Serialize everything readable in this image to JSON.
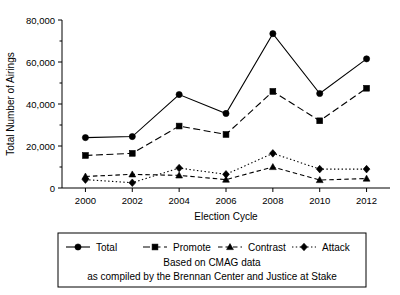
{
  "chart_data": {
    "type": "line",
    "title": "",
    "xlabel": "Election Cycle",
    "ylabel": "Total Number of Airings",
    "categories": [
      "2000",
      "2002",
      "2004",
      "2006",
      "2008",
      "2010",
      "2012"
    ],
    "x": [
      2000,
      2002,
      2004,
      2006,
      2008,
      2010,
      2012
    ],
    "xlim": [
      1999,
      2013
    ],
    "ylim": [
      0,
      80000
    ],
    "yticks": [
      0,
      20000,
      40000,
      60000,
      80000
    ],
    "ytick_labels": [
      "0",
      "20,000",
      "40,000",
      "60,000",
      "80,000"
    ],
    "yminor_ticks": [
      10000,
      30000,
      50000,
      70000
    ],
    "xtick_labels": [
      "2000",
      "2002",
      "2004",
      "2006",
      "2008",
      "2010",
      "2012"
    ],
    "grid": false,
    "legend_position": "below-plot",
    "series": [
      {
        "name": "Total",
        "marker": "circle",
        "linestyle": "solid",
        "color": "#000000",
        "values": [
          24000,
          24500,
          44500,
          35500,
          73500,
          45000,
          61500
        ]
      },
      {
        "name": "Promote",
        "marker": "square",
        "linestyle": "dashed",
        "color": "#000000",
        "values": [
          15500,
          16500,
          29500,
          25500,
          46000,
          32000,
          47500
        ]
      },
      {
        "name": "Contrast",
        "marker": "triangle",
        "linestyle": "dashed-short",
        "color": "#000000",
        "values": [
          5500,
          6500,
          6000,
          4000,
          10000,
          3800,
          4500
        ]
      },
      {
        "name": "Attack",
        "marker": "diamond",
        "linestyle": "dotted",
        "color": "#000000",
        "values": [
          4000,
          2500,
          9500,
          6500,
          16500,
          9000,
          9000
        ]
      }
    ],
    "annotations": [
      "Based on CMAG data",
      "as compiled by the Brennan Center and Justice at Stake"
    ]
  },
  "legend": {
    "entries": [
      {
        "label": "Total"
      },
      {
        "label": "Promote"
      },
      {
        "label": "Contrast"
      },
      {
        "label": "Attack"
      }
    ]
  },
  "caption": {
    "line1": "Based on CMAG data",
    "line2": "as compiled by the Brennan Center and Justice at Stake"
  }
}
